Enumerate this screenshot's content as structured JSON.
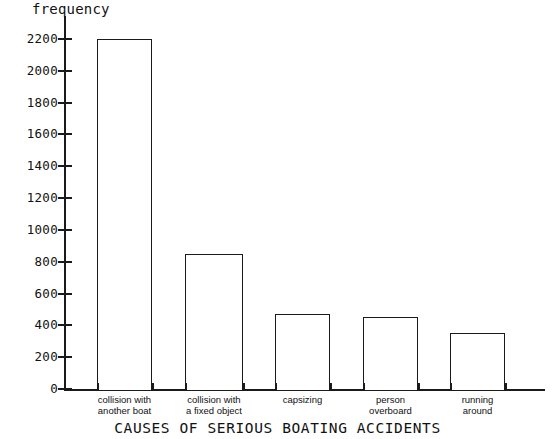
{
  "chart_data": {
    "type": "bar",
    "title": "",
    "xlabel": "CAUSES OF SERIOUS BOATING ACCIDENTS",
    "ylabel": "frequency",
    "categories": [
      "collision with\nanother boat",
      "collision with\na fixed object",
      "capsizing",
      "person\noverboard",
      "running\naround"
    ],
    "values": [
      2200,
      850,
      470,
      450,
      350
    ],
    "ylim": [
      0,
      2200
    ],
    "yticks": [
      0,
      200,
      400,
      600,
      800,
      1000,
      1200,
      1400,
      1600,
      1800,
      2000,
      2200
    ],
    "ytick_labels": [
      "0",
      "200",
      "400",
      "600",
      "800",
      "1000",
      "1200",
      "1400",
      "1600",
      "1800",
      "2000",
      "2200"
    ],
    "grid": false,
    "legend": null,
    "bar_fill_color": "#ffffff",
    "bar_edge_color": "#1a1a1a",
    "axis_color": "#1a1a1a",
    "text_color": "#111111"
  }
}
